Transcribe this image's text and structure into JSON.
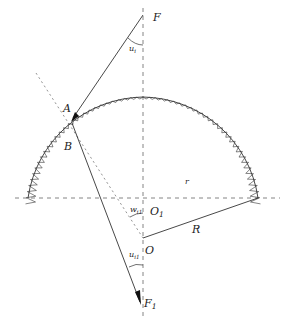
{
  "diagram": {
    "labels": {
      "F": "F",
      "u_i": "u",
      "u_i_sub": "i",
      "A": "A",
      "B": "B",
      "r": "r",
      "w": "w",
      "w_sub": "i1",
      "O1": "O",
      "O1_sub": "1",
      "O": "O",
      "R": "R",
      "u_i1": "u",
      "u_i1_sub": "i1",
      "F1": "F",
      "F1_sub": "1"
    },
    "colors": {
      "line": "#333333",
      "dashed": "#555555",
      "background": "#ffffff"
    }
  }
}
